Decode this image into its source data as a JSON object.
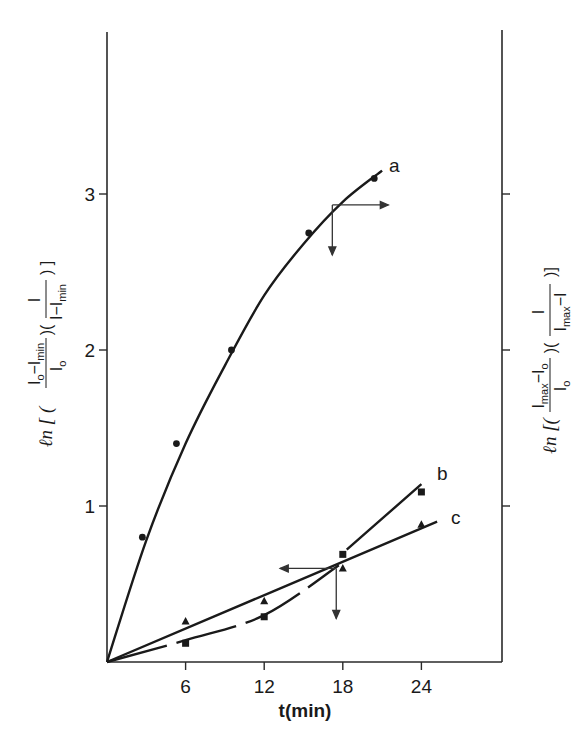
{
  "chart_data": {
    "type": "line",
    "title": "",
    "xlabel": "t(min)",
    "ylabel_left": "ln [ ( (I0 − Imin) / I0 ) ( I / (I − Imin) ) ]",
    "ylabel_right": "ln [ ( (Imax − I0) / I0 ) ( I / (Imax − I) ) ]",
    "xlim": [
      0,
      29
    ],
    "ylim": [
      0,
      4
    ],
    "x_ticks": [
      6,
      12,
      18,
      24
    ],
    "y_ticks": [
      1,
      2,
      3
    ],
    "grid": false,
    "legend": "inline labels a, b, c at line ends",
    "series": [
      {
        "name": "a",
        "marker": "circle",
        "style": "solid curve",
        "points": [
          [
            2.7,
            0.8
          ],
          [
            5.3,
            1.4
          ],
          [
            9.5,
            2.0
          ],
          [
            15.4,
            2.75
          ],
          [
            20.4,
            3.1
          ]
        ],
        "fit_curve": [
          [
            0,
            0
          ],
          [
            3,
            0.78
          ],
          [
            6,
            1.4
          ],
          [
            9,
            1.9
          ],
          [
            12,
            2.35
          ],
          [
            15,
            2.68
          ],
          [
            18,
            2.95
          ],
          [
            21,
            3.15
          ]
        ]
      },
      {
        "name": "b",
        "marker": "square",
        "style": "dashed curve then solid",
        "points": [
          [
            6,
            0.12
          ],
          [
            12,
            0.29
          ],
          [
            18,
            0.69
          ],
          [
            24,
            1.09
          ]
        ],
        "fit_curve": [
          [
            0,
            0
          ],
          [
            6,
            0.14
          ],
          [
            12,
            0.3
          ],
          [
            17.7,
            0.62
          ],
          [
            18,
            0.65
          ],
          [
            24,
            1.14
          ]
        ]
      },
      {
        "name": "c",
        "marker": "triangle",
        "style": "solid straight",
        "points": [
          [
            6,
            0.26
          ],
          [
            12,
            0.39
          ],
          [
            18,
            0.6
          ],
          [
            24,
            0.88
          ]
        ],
        "fit_curve": [
          [
            0,
            0
          ],
          [
            25.2,
            0.9
          ]
        ]
      }
    ],
    "annotations": [
      {
        "type": "arrows",
        "near_series": "a",
        "at": [
          17.2,
          2.93
        ],
        "directions": [
          "right",
          "down"
        ]
      },
      {
        "type": "arrows",
        "near_series": "b/c intersection",
        "at": [
          17.5,
          0.6
        ],
        "directions": [
          "left",
          "down"
        ]
      }
    ]
  },
  "labels": {
    "x_axis_title": "t(min)",
    "x_ticks": [
      "6",
      "12",
      "18",
      "24"
    ],
    "y_ticks": [
      "1",
      "2",
      "3"
    ],
    "series_labels": [
      "a",
      "b",
      "c"
    ],
    "left_ylabel": {
      "prefix": "ℓn [ (",
      "frac1_num": "I",
      "frac1_num_sub": "o",
      "frac1_num_mid": "−I",
      "frac1_num_sub2": "min",
      "frac1_den": "I",
      "frac1_den_sub": "o",
      "frac2_num": "I",
      "frac2_den": "I−I",
      "frac2_den_sub": "min",
      "suffix": ") ]"
    },
    "right_ylabel": {
      "prefix": "ℓn [(",
      "frac1_num": "I",
      "frac1_num_sub": "max",
      "frac1_num_mid": "−I",
      "frac1_num_sub2": "o",
      "frac1_den": "I",
      "frac1_den_sub": "o",
      "frac2_num": "I",
      "frac2_den": "I",
      "frac2_den_sub": "max",
      "frac2_den_tail": "−I",
      "suffix": ")]"
    }
  }
}
